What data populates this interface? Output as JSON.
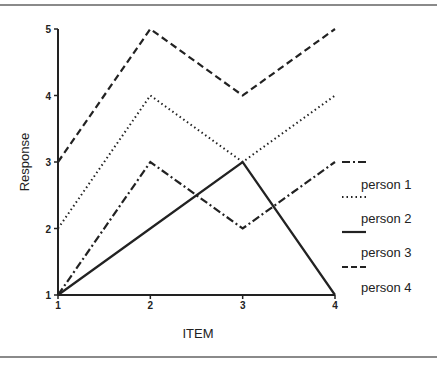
{
  "chart_data": {
    "type": "line",
    "title": "",
    "xlabel": "ITEM",
    "ylabel": "Response",
    "x": [
      1,
      2,
      3,
      4
    ],
    "xticks": [
      "1",
      "2",
      "3",
      "4"
    ],
    "yticks": [
      "1",
      "2",
      "3",
      "4",
      "5"
    ],
    "xlim": [
      1,
      4
    ],
    "ylim": [
      1,
      5
    ],
    "grid": false,
    "legend_position": "right",
    "series": [
      {
        "name": "person 1",
        "style": "dash-dot",
        "values": [
          1,
          3,
          2,
          3
        ]
      },
      {
        "name": "person 2",
        "style": "dotted",
        "values": [
          2,
          4,
          3,
          4
        ]
      },
      {
        "name": "person 3",
        "style": "solid",
        "values": [
          1,
          2,
          3,
          1
        ]
      },
      {
        "name": "person 4",
        "style": "dashed",
        "values": [
          3,
          5,
          4,
          5
        ]
      }
    ],
    "line_color": "#222222"
  }
}
